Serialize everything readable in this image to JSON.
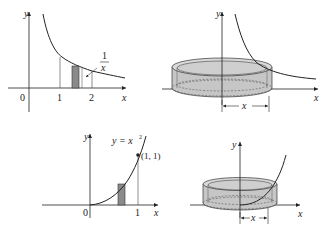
{
  "panels": {
    "p1": {
      "title": "area under y = 1/x",
      "y_axis_label": "y",
      "x_axis_label": "x",
      "origin_label": "0",
      "tick1": "1",
      "tick2": "2",
      "curve_label_num": "1",
      "curve_label_den": "x"
    },
    "p2": {
      "y_axis_label": "y",
      "x_axis_label": "x",
      "radius_label": "x"
    },
    "p3": {
      "y_axis_label": "y",
      "x_axis_label": "x",
      "origin_label": "0",
      "tick1": "1",
      "curve_label": "y = x",
      "curve_label_exp": "2",
      "point_label": "(1, 1)"
    },
    "p4": {
      "y_axis_label": "y",
      "x_axis_label": "x",
      "radius_label": "x"
    }
  },
  "colors": {
    "line": "#222222",
    "shade": "#9a9a9a",
    "cyl_fill": "#c8c8c8",
    "cyl_top": "#dedede"
  }
}
